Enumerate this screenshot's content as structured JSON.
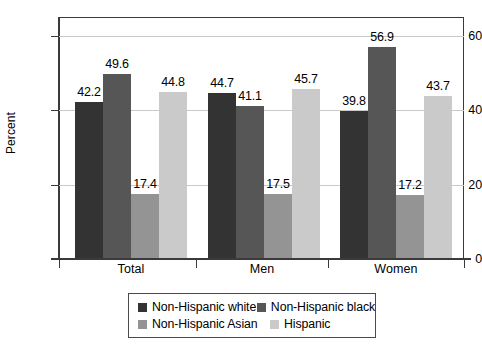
{
  "chart_data": {
    "type": "bar",
    "title": "",
    "xlabel": "",
    "ylabel": "Percent",
    "ylim": [
      0,
      65
    ],
    "yticks": [
      0,
      20,
      40,
      60
    ],
    "ytick_labels": [
      "0",
      "20",
      "40",
      "60"
    ],
    "grid": true,
    "grid_axis": "y",
    "legend_position": "bottom",
    "categories": [
      "Total",
      "Men",
      "Women"
    ],
    "series": [
      {
        "name": "Non-Hispanic white",
        "color": "#333333",
        "values": [
          42.2,
          44.7,
          39.8
        ],
        "labels": [
          "42.2",
          "44.7",
          "39.8"
        ]
      },
      {
        "name": "Non-Hispanic black",
        "color": "#565656",
        "values": [
          49.6,
          41.1,
          56.9
        ],
        "labels": [
          "49.6",
          "41.1",
          "56.9"
        ]
      },
      {
        "name": "Non-Hispanic Asian",
        "color": "#949494",
        "values": [
          17.4,
          17.5,
          17.2
        ],
        "labels": [
          "17.4",
          "17.5",
          "17.2"
        ]
      },
      {
        "name": "Hispanic",
        "color": "#cacaca",
        "values": [
          44.8,
          45.7,
          43.7
        ],
        "labels": [
          "44.8",
          "45.7",
          "43.7"
        ]
      }
    ]
  },
  "axis": {
    "y_title": "Percent",
    "y_tick_labels": [
      "60",
      "40",
      "20",
      "0"
    ]
  },
  "groups": [
    {
      "label": "Total"
    },
    {
      "label": "Men"
    },
    {
      "label": "Women"
    }
  ],
  "legend": {
    "entries": [
      {
        "label": "Non-Hispanic white",
        "color": "#333333"
      },
      {
        "label": "Non-Hispanic black",
        "color": "#565656"
      },
      {
        "label": "Non-Hispanic Asian",
        "color": "#949494"
      },
      {
        "label": "Hispanic",
        "color": "#cacaca"
      }
    ]
  }
}
